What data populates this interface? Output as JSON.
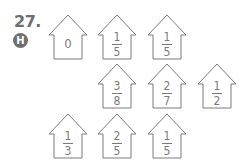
{
  "problem": {
    "number": "27.",
    "badge": "H"
  },
  "houses": [
    {
      "row": 1,
      "value": "0"
    },
    {
      "row": 1,
      "numerator": "1",
      "denominator": "5"
    },
    {
      "row": 1,
      "numerator": "1",
      "denominator": "5"
    },
    {
      "row": 2,
      "numerator": "3",
      "denominator": "8"
    },
    {
      "row": 2,
      "numerator": "2",
      "denominator": "7"
    },
    {
      "row": 2,
      "numerator": "1",
      "denominator": "2"
    },
    {
      "row": 3,
      "numerator": "1",
      "denominator": "3"
    },
    {
      "row": 3,
      "numerator": "2",
      "denominator": "5"
    },
    {
      "row": 3,
      "numerator": "1",
      "denominator": "5"
    }
  ],
  "colors": {
    "stroke": "#7a7b7d",
    "label": "#6d6e70"
  }
}
